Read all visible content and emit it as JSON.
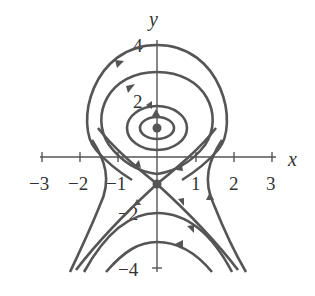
{
  "diagram": {
    "type": "phase-portrait",
    "axes": {
      "x_label": "x",
      "y_label": "y"
    },
    "x_ticks": [
      "−3",
      "−2",
      "−1",
      "1",
      "2",
      "3"
    ],
    "y_ticks": [
      "4",
      "2",
      "−2",
      "−4"
    ],
    "equilibria": [
      {
        "type": "center",
        "x": 0,
        "y": 1
      },
      {
        "type": "saddle",
        "x": 0,
        "y": -1
      }
    ],
    "colors": {
      "curve": "#555555",
      "axis": "#555555"
    }
  }
}
